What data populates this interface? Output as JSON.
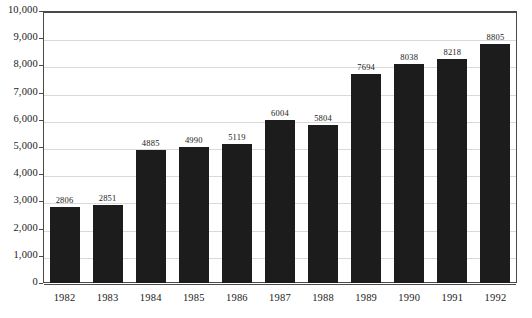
{
  "chart_data": {
    "type": "bar",
    "title": "",
    "subtitle": "",
    "xlabel": "",
    "ylabel": "",
    "categories": [
      "1982",
      "1983",
      "1984",
      "1985",
      "1986",
      "1987",
      "1988",
      "1989",
      "1990",
      "1991",
      "1992"
    ],
    "values": [
      2806,
      2851,
      4885,
      4990,
      5119,
      6004,
      5804,
      7694,
      8038,
      8218,
      8805
    ],
    "data_labels": [
      "2806",
      "2851",
      "4885",
      "4990",
      "5119",
      "6004",
      "5804",
      "7694",
      "8038",
      "8218",
      "8805"
    ],
    "ylim": [
      0,
      10000
    ],
    "ytick_values": [
      0,
      1000,
      2000,
      3000,
      4000,
      5000,
      6000,
      7000,
      8000,
      9000,
      10000
    ],
    "ytick_labels": [
      "0",
      "1,000",
      "2,000",
      "3,000",
      "4,000",
      "5,000",
      "6,000",
      "7,000",
      "8,000",
      "9,000",
      "10,000"
    ],
    "grid": true,
    "grid_axis": "y",
    "legend": false,
    "legend_position": "none",
    "series": [
      {
        "name": "",
        "values": [
          2806,
          2851,
          4885,
          4990,
          5119,
          6004,
          5804,
          7694,
          8038,
          8218,
          8805
        ]
      }
    ]
  },
  "style": {
    "bar_color": "#1c1c1c",
    "gridline_color": "#d9d9d9",
    "axis_color": "#4a4a4a",
    "text_color": "#1a1a1a",
    "background_color": "#ffffff"
  }
}
